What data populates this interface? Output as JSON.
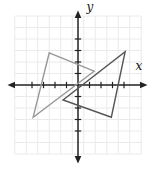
{
  "figure": {
    "title": "",
    "colors": {
      "background": "#ffffff",
      "grid": "#eaeaea",
      "axis": "#222222",
      "triangle_light": "#979797",
      "triangle_dark": "#545454",
      "label": "#111111"
    }
  },
  "chart_data": {
    "type": "line",
    "title": "",
    "xlabel": "x",
    "ylabel": "y",
    "xlim": [
      -6,
      6
    ],
    "ylim": [
      -6.5,
      6.5
    ],
    "grid": true,
    "legend": "none",
    "x_ticks": [
      -4,
      -3,
      -2,
      -1,
      1,
      2,
      3,
      4
    ],
    "y_ticks": [
      -4,
      -3,
      -2,
      -1,
      1,
      2,
      3,
      4
    ],
    "series": [
      {
        "name": "triangle-gray-light",
        "closed": true,
        "color_key": "triangle_light",
        "points": [
          [
            -2.5,
            2.8
          ],
          [
            1.4,
            1.2
          ],
          [
            -3.9,
            -2.8
          ]
        ]
      },
      {
        "name": "triangle-gray-dark",
        "closed": true,
        "color_key": "triangle_dark",
        "points": [
          [
            4.1,
            2.9
          ],
          [
            2.9,
            -2.8
          ],
          [
            -1.3,
            -1.3
          ]
        ]
      }
    ]
  }
}
